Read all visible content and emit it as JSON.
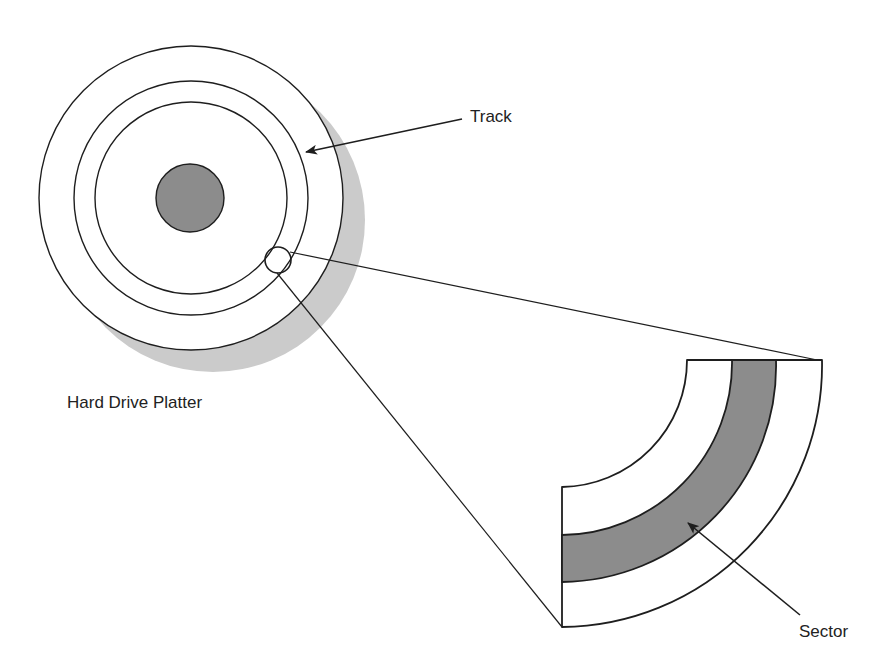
{
  "diagram": {
    "labels": {
      "track": "Track",
      "platter": "Hard Drive Platter",
      "sector": "Sector"
    },
    "colors": {
      "stroke": "#1e1e1e",
      "hub_fill": "#8c8c8c",
      "sector_fill": "#8c8c8c",
      "shadow_fill": "#cbcbcb",
      "background": "#ffffff"
    },
    "platter": {
      "center": [
        191,
        198
      ],
      "rings_radii": [
        152,
        117,
        96
      ],
      "hub_radius": 34,
      "shadow_offset": [
        22,
        22
      ]
    },
    "magnifier": {
      "center": [
        278,
        260
      ],
      "radius": 13
    },
    "sector_detail": {
      "arc_center": [
        560,
        360
      ],
      "radii": [
        127,
        172,
        216,
        262
      ],
      "highlighted_band": [
        172,
        216
      ]
    }
  }
}
